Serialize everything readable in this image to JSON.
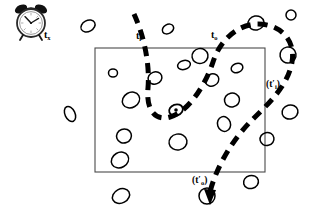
{
  "figure": {
    "kind": "hand-drawn-schematic",
    "background_color": "#ffffff",
    "ink_color": "#000000"
  },
  "labels": {
    "clock_time": {
      "base": "t",
      "sub": "x",
      "prime": false,
      "paren": false,
      "text": "tx"
    },
    "enter_time": {
      "base": "t",
      "sub": "i",
      "prime": false,
      "paren": false,
      "text": "ti"
    },
    "exit_time": {
      "base": "t",
      "sub": "o",
      "prime": false,
      "paren": false,
      "text": "to"
    },
    "reenter_time": {
      "base": "t",
      "sub": "i",
      "prime": true,
      "paren": true,
      "text": "(t'i)"
    },
    "reexit_time": {
      "base": "t",
      "sub": "o",
      "prime": true,
      "paren": true,
      "text": "(t'o)"
    }
  },
  "clock": {
    "name": "alarm-clock",
    "center": [
      31,
      21
    ],
    "face_radius": 13,
    "hour_hand_angle_deg": -120,
    "minute_hand_angle_deg": -35,
    "bells": 2,
    "legs": 2
  },
  "region": {
    "name": "observation-box",
    "x": 95,
    "y": 48,
    "width": 170,
    "height": 124,
    "stroke": "#444444",
    "stroke_width": 1
  },
  "tagged_particle": {
    "name": "tagged-particle",
    "cx": 176,
    "cy": 110,
    "rx": 7,
    "ry": 5.5,
    "rotation": -20,
    "dot_radius": 1.8
  },
  "trajectory": {
    "name": "particle-trajectory",
    "style": "dashed",
    "dash_pattern": "10 7",
    "stroke_width": 5,
    "has_arrowhead": true,
    "arrowhead_at": [
      210,
      197
    ],
    "path": "M 134 14 C 144 36, 150 64, 148 88 C 146 108, 154 122, 170 117 C 188 112, 205 86, 213 62 C 220 40, 238 24, 258 24 C 280 24, 296 40, 292 62 C 288 86, 268 104, 252 120 C 232 140, 216 168, 210 192"
  },
  "particles": [
    {
      "cx": 88,
      "cy": 26,
      "rx": 7.5,
      "ry": 5.5,
      "rot": -28
    },
    {
      "cx": 168,
      "cy": 29,
      "rx": 6,
      "ry": 4.5,
      "rot": -30
    },
    {
      "cx": 256,
      "cy": 23,
      "rx": 8,
      "ry": 7,
      "rot": -10
    },
    {
      "cx": 113,
      "cy": 73,
      "rx": 4.5,
      "ry": 4,
      "rot": 0
    },
    {
      "cx": 155,
      "cy": 78,
      "rx": 7,
      "ry": 6,
      "rot": -20
    },
    {
      "cx": 184,
      "cy": 65,
      "rx": 6.5,
      "ry": 4.5,
      "rot": -15
    },
    {
      "cx": 200,
      "cy": 56,
      "rx": 8,
      "ry": 7.5,
      "rot": -10
    },
    {
      "cx": 212,
      "cy": 80,
      "rx": 7,
      "ry": 6,
      "rot": -25
    },
    {
      "cx": 237,
      "cy": 68,
      "rx": 6,
      "ry": 4.5,
      "rot": -20
    },
    {
      "cx": 131,
      "cy": 100,
      "rx": 9,
      "ry": 7.5,
      "rot": -30
    },
    {
      "cx": 232,
      "cy": 100,
      "rx": 7.5,
      "ry": 7,
      "rot": -12
    },
    {
      "cx": 70,
      "cy": 114,
      "rx": 5,
      "ry": 8,
      "rot": -25
    },
    {
      "cx": 124,
      "cy": 136,
      "rx": 7.5,
      "ry": 7,
      "rot": -20
    },
    {
      "cx": 178,
      "cy": 142,
      "rx": 9,
      "ry": 8,
      "rot": -10
    },
    {
      "cx": 224,
      "cy": 124,
      "rx": 6.5,
      "ry": 7.5,
      "rot": -18
    },
    {
      "cx": 120,
      "cy": 160,
      "rx": 9,
      "ry": 7.5,
      "rot": -30
    },
    {
      "cx": 267,
      "cy": 139,
      "rx": 7,
      "ry": 6.5,
      "rot": -12
    },
    {
      "cx": 290,
      "cy": 112,
      "rx": 8,
      "ry": 7,
      "rot": -15
    },
    {
      "cx": 288,
      "cy": 55,
      "rx": 8,
      "ry": 8,
      "rot": -10
    },
    {
      "cx": 291,
      "cy": 15,
      "rx": 5,
      "ry": 5,
      "rot": 0
    },
    {
      "cx": 251,
      "cy": 182,
      "rx": 7.5,
      "ry": 6.5,
      "rot": -15
    },
    {
      "cx": 121,
      "cy": 196,
      "rx": 9,
      "ry": 7,
      "rot": -28
    },
    {
      "cx": 207,
      "cy": 196,
      "rx": 8,
      "ry": 8,
      "rot": 0
    }
  ]
}
